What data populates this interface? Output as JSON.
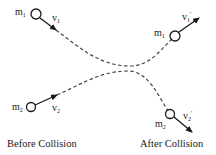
{
  "diagram": {
    "colors": {
      "stroke": "#1a1a1a",
      "background": "#ffffff"
    },
    "before": {
      "caption": "Before Collision",
      "mass1": {
        "label": "m",
        "sub": "1",
        "velocity": "v",
        "velocity_sub": "1"
      },
      "mass2": {
        "label": "m",
        "sub": "2",
        "velocity": "v",
        "velocity_sub": "2"
      }
    },
    "after": {
      "caption": "After Collision",
      "mass1": {
        "label": "m",
        "sub": "1",
        "velocity": "v",
        "velocity_sub": "1",
        "prime": "'"
      },
      "mass2": {
        "label": "m",
        "sub": "2",
        "velocity": "v",
        "velocity_sub": "2",
        "prime": "'"
      }
    }
  }
}
